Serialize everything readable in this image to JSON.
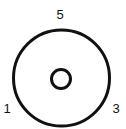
{
  "diagram": {
    "type": "connector-pinout",
    "outer_circle": {
      "cx": 61.5,
      "cy": 78,
      "r": 48,
      "stroke": "#111111",
      "stroke_width": 3
    },
    "inner_circle": {
      "cx": 61,
      "cy": 79,
      "r": 9.5,
      "stroke": "#111111",
      "stroke_width": 3
    },
    "labels": [
      {
        "text": "5",
        "x": 60,
        "y": 19,
        "anchor": "middle"
      },
      {
        "text": "1",
        "x": 7,
        "y": 113,
        "anchor": "middle"
      },
      {
        "text": "3",
        "x": 116,
        "y": 113,
        "anchor": "middle"
      }
    ]
  }
}
